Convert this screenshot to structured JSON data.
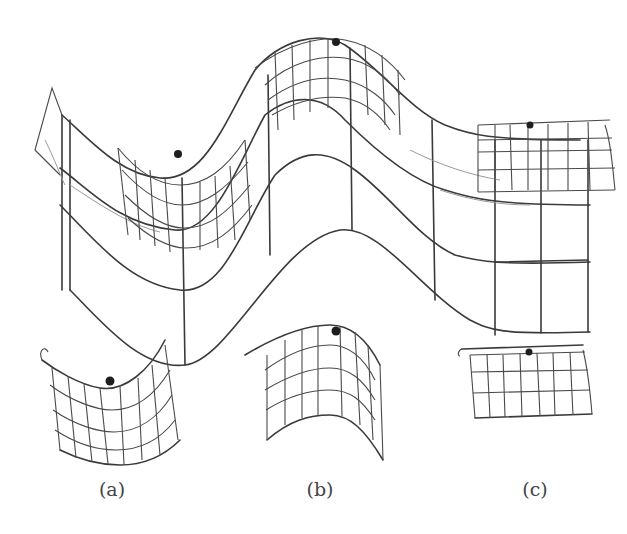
{
  "figure": {
    "colors": {
      "stroke": "#3a3a3a",
      "faint_stroke": "#9a9a9a",
      "marker": "#1e1e1e",
      "background": "#ffffff"
    },
    "main_surface": {
      "name": "wave-surface",
      "patch_count": 3
    },
    "patches": [
      {
        "id": "a",
        "label": "(a)",
        "shape": "concave trough patch",
        "cx": 112
      },
      {
        "id": "b",
        "label": "(b)",
        "shape": "convex crest patch",
        "cx": 320
      },
      {
        "id": "c",
        "label": "(c)",
        "shape": "nearly flat patch",
        "cx": 535
      }
    ]
  }
}
